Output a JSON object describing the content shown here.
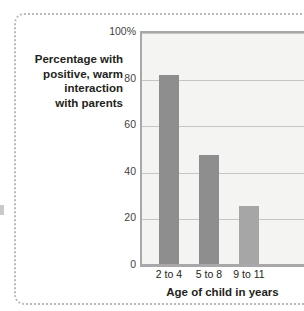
{
  "figure": {
    "width": 304,
    "height": 311,
    "background": "#ffffff",
    "frame_style": "dotted",
    "frame_color": "#b9b9b9"
  },
  "chart_data": {
    "type": "bar",
    "title": "",
    "subtitle": "",
    "xlabel": "Age of child in years",
    "ylabel": "Percentage with\npositive, warm\ninteraction\nwith parents",
    "categories": [
      "2 to 4",
      "5 to 8",
      "9 to 11"
    ],
    "values": [
      81,
      47,
      25
    ],
    "series": [
      {
        "name": "Percentage with positive, warm interaction with parents",
        "values": [
          81,
          47,
          25
        ]
      }
    ],
    "ylim": [
      0,
      100
    ],
    "ytick_values": [
      0,
      20,
      40,
      60,
      80,
      100
    ],
    "ytick_labels": [
      "0",
      "20",
      "40",
      "60",
      "80",
      "100%"
    ],
    "grid": true,
    "grid_axis": "y",
    "grid_color": "#c6c6c6",
    "legend": false,
    "legend_position": "none",
    "bar_colors": [
      "#8e8e8e",
      "#8e8e8e",
      "#a6a6a6"
    ],
    "plot_background": "#f4f4f2",
    "axis_color": "#a8a8a8",
    "text_color": "#231f20"
  }
}
